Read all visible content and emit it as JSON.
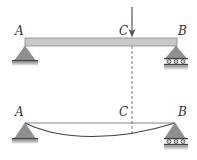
{
  "figure": {
    "type": "beam-deflection-diagram",
    "colors": {
      "beam_fill": "#c9c9c9",
      "beam_stroke": "#8a8a8a",
      "support_fill": "#8f8f8f",
      "ground_fill": "#9a9a9a",
      "line": "#555555",
      "dashed": "#777777",
      "label": "#333333"
    },
    "top_panel": {
      "description": "Simply supported beam with point load at C",
      "labels": {
        "A": "A",
        "B": "B",
        "C": "C"
      },
      "support_A": "pin",
      "support_B": "roller",
      "load": "downward point load at C"
    },
    "bottom_panel": {
      "description": "Deflected shape of beam",
      "labels": {
        "A": "A",
        "B": "B",
        "C": "C"
      },
      "support_A": "pin",
      "support_B": "roller"
    }
  }
}
